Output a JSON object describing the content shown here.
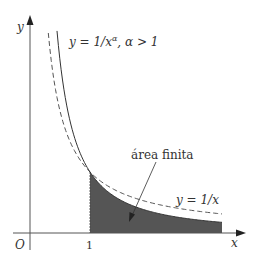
{
  "diagram": {
    "axes": {
      "x_label": "x",
      "y_label": "y",
      "origin_label": "O",
      "tick_label_1": "1"
    },
    "curves": [
      {
        "name": "power-curve",
        "label": "y = 1/x^α, α > 1",
        "style": "solid"
      },
      {
        "name": "harmonic-curve",
        "label": "y = 1/x",
        "style": "dashed"
      }
    ],
    "labels": {
      "power_curve_prefix": "y = 1/x",
      "power_curve_exp": "α",
      "power_curve_suffix": ", α > 1",
      "harmonic_curve": "y = 1/x",
      "area": "área finita"
    },
    "colors": {
      "axis": "#555555",
      "curve": "#444444",
      "shade": "#555555"
    }
  }
}
